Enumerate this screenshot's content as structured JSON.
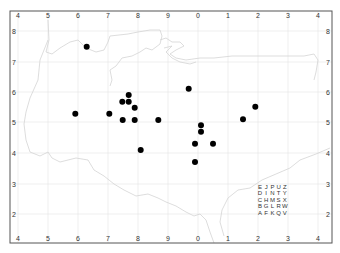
{
  "map": {
    "frame": {
      "left": 10,
      "top": 11,
      "right": 332,
      "bottom": 243
    },
    "colors": {
      "frame": "#555555",
      "gridline": "#e4e4e4",
      "coastline": "#d4d4d4",
      "point": "#000000",
      "label": "#333333"
    },
    "top_ticks": [
      {
        "label": "4",
        "x": 18
      },
      {
        "label": "5",
        "x": 48
      },
      {
        "label": "6",
        "x": 78
      },
      {
        "label": "7",
        "x": 108
      },
      {
        "label": "8",
        "x": 138
      },
      {
        "label": "9",
        "x": 168
      },
      {
        "label": "0",
        "x": 198
      },
      {
        "label": "1",
        "x": 228
      },
      {
        "label": "2",
        "x": 258
      },
      {
        "label": "3",
        "x": 288
      },
      {
        "label": "4",
        "x": 318
      }
    ],
    "bottom_ticks": [
      {
        "label": "4",
        "x": 18
      },
      {
        "label": "5",
        "x": 48
      },
      {
        "label": "6",
        "x": 78
      },
      {
        "label": "7",
        "x": 108
      },
      {
        "label": "8",
        "x": 138
      },
      {
        "label": "9",
        "x": 168
      },
      {
        "label": "0",
        "x": 198
      },
      {
        "label": "1",
        "x": 228
      },
      {
        "label": "2",
        "x": 258
      },
      {
        "label": "3",
        "x": 288
      },
      {
        "label": "4",
        "x": 318
      }
    ],
    "left_ticks": [
      {
        "label": "8",
        "y": 31
      },
      {
        "label": "7",
        "y": 62
      },
      {
        "label": "6",
        "y": 92
      },
      {
        "label": "5",
        "y": 122
      },
      {
        "label": "4",
        "y": 153
      },
      {
        "label": "3",
        "y": 184
      },
      {
        "label": "2",
        "y": 214
      }
    ],
    "right_ticks": [
      {
        "label": "8",
        "y": 31
      },
      {
        "label": "7",
        "y": 62
      },
      {
        "label": "6",
        "y": 92
      },
      {
        "label": "5",
        "y": 122
      },
      {
        "label": "4",
        "y": 153
      },
      {
        "label": "3",
        "y": 184
      },
      {
        "label": "2",
        "y": 214
      }
    ],
    "points": [
      {
        "x": 86.7,
        "y": 46.7
      },
      {
        "x": 75.3,
        "y": 113.7
      },
      {
        "x": 109.3,
        "y": 113.7
      },
      {
        "x": 128.7,
        "y": 95
      },
      {
        "x": 122.3,
        "y": 101.7
      },
      {
        "x": 128.7,
        "y": 101.7
      },
      {
        "x": 134.7,
        "y": 107.7
      },
      {
        "x": 122.7,
        "y": 120
      },
      {
        "x": 134.7,
        "y": 120
      },
      {
        "x": 158.3,
        "y": 120
      },
      {
        "x": 140.7,
        "y": 150
      },
      {
        "x": 188.7,
        "y": 88.7
      },
      {
        "x": 255.3,
        "y": 106.7
      },
      {
        "x": 243,
        "y": 119.3
      },
      {
        "x": 201,
        "y": 125.3
      },
      {
        "x": 201,
        "y": 131.7
      },
      {
        "x": 195,
        "y": 143.7
      },
      {
        "x": 213,
        "y": 143.7
      },
      {
        "x": 195,
        "y": 162
      }
    ],
    "letter_grid": {
      "origin_x": 260,
      "origin_y": 189,
      "col_step": 6.2,
      "row_step": 6.4,
      "rows": [
        [
          "E",
          "J",
          "P",
          "U",
          "Z"
        ],
        [
          "D",
          "I",
          "N",
          "T",
          "Y"
        ],
        [
          "C",
          "H",
          "M",
          "S",
          "X"
        ],
        [
          "B",
          "G",
          "L",
          "R",
          "W"
        ],
        [
          "A",
          "F",
          "K",
          "Q",
          "V"
        ]
      ]
    }
  }
}
